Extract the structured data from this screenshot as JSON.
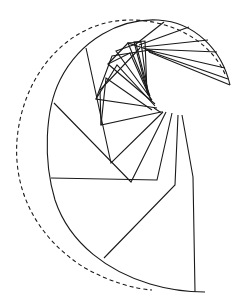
{
  "diagram": {
    "width": 244,
    "height": 306,
    "stroke_color": "#1a1a1a",
    "background": "#ffffff",
    "outer_dashed_arc": "M 225 74 C 205 30, 150 14, 110 22 C 60 32, 22 80, 17 140 C 13 195, 40 240, 85 268 C 110 282, 135 289, 152 290",
    "inner_solid_arc": "M 230 85 C 222 50, 195 22, 158 20 C 120 18, 80 40, 60 80 C 45 110, 43 160, 55 200 C 70 245, 110 272, 150 284 C 170 290, 190 292, 205 292",
    "folds": [
      {
        "name": "fold-bottom-vertical",
        "points": "182,115 193,177 195,292"
      },
      {
        "name": "fold-bottom-lower",
        "points": "178,115 175,185 104,258"
      },
      {
        "name": "fold-left-horizontal",
        "points": "172,113 157,180 51,178"
      },
      {
        "name": "fold-left-lower",
        "points": "166,112 131,182 54,103"
      },
      {
        "name": "fold-left-mid",
        "points": "163,112 111,163 86,48"
      },
      {
        "name": "fold-inner-1",
        "points": "161,112 101,125 106,78 152,110"
      },
      {
        "name": "fold-inner-2",
        "points": "157,108 96,99 117,65 155,106"
      },
      {
        "name": "fold-inner-3",
        "points": "155,104 108,64 130,53 152,102"
      },
      {
        "name": "fold-inner-4",
        "points": "152,100 116,51 136,44 150,98"
      },
      {
        "name": "fold-inner-5",
        "points": "150,96 128,43 141,42 148,95"
      },
      {
        "name": "fold-inner-6",
        "points": "148,94 134,42 145,41 147,93"
      },
      {
        "name": "fold-top-1",
        "points": "136,44 164,22"
      },
      {
        "name": "fold-top-2",
        "points": "139,45 189,27"
      },
      {
        "name": "fold-top-3",
        "points": "143,47 208,40"
      },
      {
        "name": "fold-top-4",
        "points": "145,49 217,52"
      },
      {
        "name": "fold-top-5",
        "points": "147,50 225,68"
      },
      {
        "name": "fold-top-6",
        "points": "148,51 228,79"
      },
      {
        "name": "fold-top-7",
        "points": "149,52 230,85"
      },
      {
        "name": "fold-top-8",
        "points": "108,64 128,43 155,52"
      },
      {
        "name": "fold-top-9",
        "points": "96,99 112,56 150,50"
      },
      {
        "name": "fold-top-10",
        "points": "101,125 100,90 140,48"
      },
      {
        "name": "fold-spiral-tail",
        "points": "163,112 160,112 154,108"
      }
    ]
  }
}
